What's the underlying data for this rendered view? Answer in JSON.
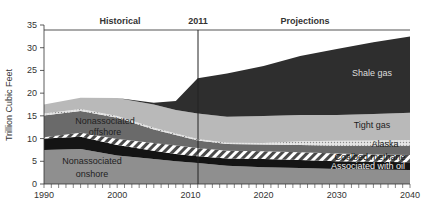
{
  "chart_data": {
    "type": "area",
    "stacked": true,
    "title": "",
    "xlabel": "",
    "ylabel": "Trillion Cubic Feet",
    "xlim": [
      1990,
      2040
    ],
    "ylim": [
      0,
      35
    ],
    "x_ticks": [
      1990,
      2000,
      2010,
      2020,
      2030,
      2040
    ],
    "y_ticks": [
      0,
      5,
      10,
      15,
      20,
      25,
      30,
      35
    ],
    "period_labels": {
      "historical": "Historical",
      "divider": "2011",
      "projections": "Projections"
    },
    "divider_year": 2011,
    "x": [
      1990,
      1995,
      2000,
      2005,
      2008,
      2011,
      2015,
      2020,
      2025,
      2030,
      2035,
      2040
    ],
    "series": [
      {
        "name": "Nonassociated onshore",
        "color": "#8f8f8f",
        "values": [
          7.5,
          7.7,
          6.3,
          5.5,
          5.0,
          4.6,
          4.0,
          3.7,
          3.5,
          3.3,
          3.2,
          3.1
        ]
      },
      {
        "name": "Associated with oil",
        "color": "#141414",
        "values": [
          2.5,
          2.7,
          2.3,
          1.8,
          1.6,
          1.5,
          1.6,
          1.8,
          1.8,
          1.7,
          1.7,
          1.7
        ]
      },
      {
        "name": "Coalbed methane",
        "color": "hatch",
        "values": [
          0.3,
          0.9,
          1.3,
          1.7,
          1.9,
          1.8,
          1.7,
          1.7,
          1.7,
          1.7,
          1.6,
          1.6
        ]
      },
      {
        "name": "Nonassociated offshore",
        "color": "#6a6a6a",
        "values": [
          4.8,
          4.8,
          4.7,
          3.0,
          2.3,
          1.7,
          1.5,
          1.5,
          1.6,
          1.7,
          1.9,
          2.0
        ]
      },
      {
        "name": "Alaska",
        "color": "dots",
        "values": [
          0.4,
          0.4,
          0.4,
          0.4,
          0.3,
          0.3,
          0.3,
          0.3,
          0.8,
          1.1,
          1.2,
          1.3
        ]
      },
      {
        "name": "Tight gas",
        "color": "#b9b9b9",
        "values": [
          2.0,
          2.5,
          3.9,
          5.1,
          5.2,
          5.6,
          5.7,
          6.0,
          5.8,
          5.7,
          5.8,
          6.0
        ]
      },
      {
        "name": "Shale gas",
        "color": "#2e2e2e",
        "values": [
          0.0,
          0.0,
          0.0,
          0.4,
          2.0,
          7.8,
          9.5,
          11.0,
          13.0,
          14.5,
          15.8,
          16.8
        ]
      }
    ],
    "annotations": [
      {
        "text": "Shale gas",
        "x": 2035,
        "y": 25
      },
      {
        "text": "Tight gas",
        "x": 2035,
        "y": 14
      },
      {
        "text": "Alaska",
        "x": 2036,
        "y": 9.2
      },
      {
        "text": "Coalbed methane",
        "x": 2035,
        "y": 5.8
      },
      {
        "text": "Associated with oil",
        "x": 2035,
        "y": 3.9
      },
      {
        "text": "Nonassociated offshore",
        "x": 1997,
        "y": 12
      },
      {
        "text": "Nonassociated onshore",
        "x": 1997,
        "y": 3.5
      }
    ],
    "grid": false,
    "legend": "inline labels"
  },
  "labels": {
    "ylabel": "Trillion Cubic Feet",
    "historical": "Historical",
    "divider": "2011",
    "projections": "Projections",
    "shale": "Shale gas",
    "tight": "Tight gas",
    "alaska": "Alaska",
    "coalbed": "Coalbed methane",
    "assoc": "Associated with oil",
    "offshore_1": "Nonassociated",
    "offshore_2": "offshore",
    "onshore_1": "Nonassociated",
    "onshore_2": "onshore"
  },
  "ticks": {
    "y": [
      "0",
      "5",
      "10",
      "15",
      "20",
      "25",
      "30",
      "35"
    ],
    "x": [
      "1990",
      "2000",
      "2010",
      "2020",
      "2030",
      "2040"
    ]
  }
}
